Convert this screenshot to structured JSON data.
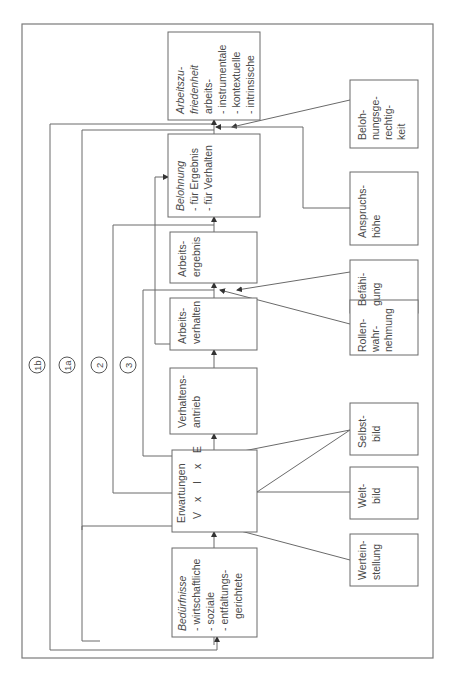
{
  "diagram": {
    "orientation": "rotated-90-ccw",
    "boxes": {
      "arbeitszufriedenheit": {
        "title": "Arbeitszu-",
        "title2": "friedenheit",
        "lines": [
          "arbeits-",
          "- instrumentale",
          "- kontextuelle",
          "- intrinsische"
        ]
      },
      "belohnung": {
        "title": "Belohnung",
        "lines": [
          "- für Ergebnis",
          "- für Verhalten"
        ]
      },
      "arbeitsergebnis": {
        "lines": [
          "Arbeits-",
          "ergebnis"
        ]
      },
      "arbeitsverhalten": {
        "lines": [
          "Arbeits-",
          "verhalten"
        ]
      },
      "verhaltensantrieb": {
        "lines": [
          "Verhaltens-",
          "antrieb"
        ]
      },
      "erwartungen": {
        "title": "Erwartungen",
        "formula": [
          "V",
          "x",
          "I",
          "x",
          "E"
        ]
      },
      "beduerfnisse": {
        "title": "Bedürfnisse",
        "lines": [
          "- wirtschaftliche",
          "- soziale",
          "- entfaltungs-",
          "gerichtete"
        ]
      },
      "belohnungsgerechtigkeit": {
        "lines": [
          "Beloh-",
          "nungsge-",
          "rechtig-",
          "keit"
        ]
      },
      "anspruchshoehe": {
        "lines": [
          "Anspruchs-",
          "höhe"
        ]
      },
      "befaehigung": {
        "lines": [
          "Befähi-",
          "gung"
        ]
      },
      "rollenwahrnehmung": {
        "lines": [
          "Rollen-",
          "wahr-",
          "nehmung"
        ]
      },
      "selbstbild": {
        "lines": [
          "Selbst-",
          "bild"
        ]
      },
      "weltbild": {
        "lines": [
          "Welt-",
          "bild"
        ]
      },
      "werteinstellung": {
        "lines": [
          "Wertein-",
          "stellung"
        ]
      }
    },
    "loops": [
      {
        "id": "1b",
        "label": "1b"
      },
      {
        "id": "1a",
        "label": "1a"
      },
      {
        "id": "2",
        "label": "2"
      },
      {
        "id": "3",
        "label": "3"
      }
    ]
  }
}
